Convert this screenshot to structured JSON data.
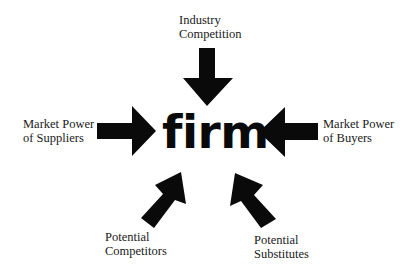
{
  "diagram": {
    "center": {
      "label": "firm"
    },
    "forces": [
      {
        "id": "industry-competition",
        "line1": "Industry",
        "line2": "Competition",
        "direction": "down"
      },
      {
        "id": "suppliers",
        "line1": "Market Power",
        "line2": "of Suppliers",
        "direction": "right"
      },
      {
        "id": "buyers",
        "line1": "Market Power",
        "line2": "of Buyers",
        "direction": "left"
      },
      {
        "id": "potential-competitors",
        "line1": "Potential",
        "line2": "Competitors",
        "direction": "up-right"
      },
      {
        "id": "potential-substitutes",
        "line1": "Potential",
        "line2": "Substitutes",
        "direction": "up-left"
      }
    ],
    "colors": {
      "arrow": "#0a0a0a",
      "text": "#1a1a1a",
      "background": "#ffffff"
    }
  }
}
